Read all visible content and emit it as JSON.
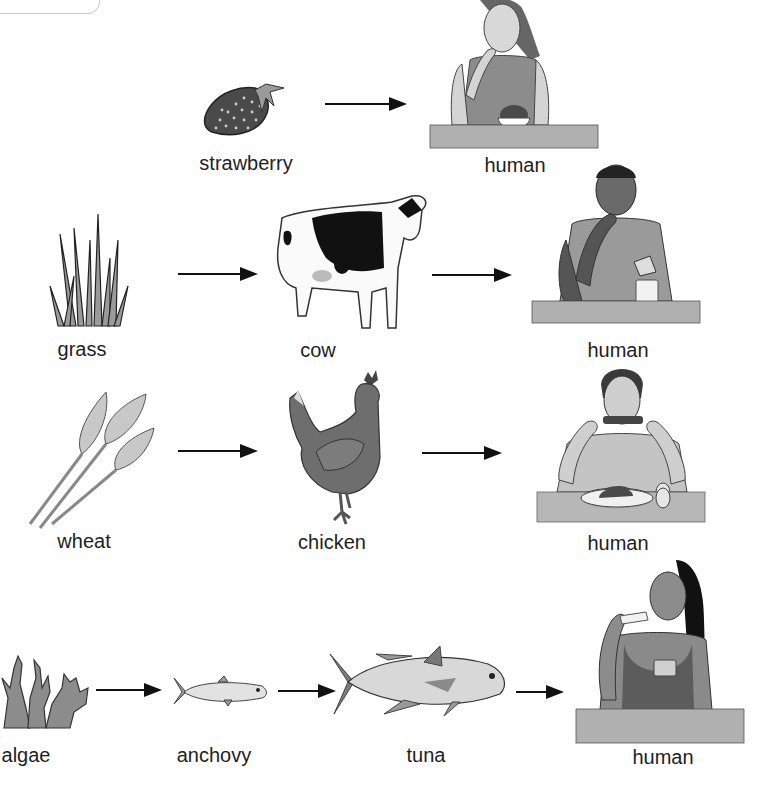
{
  "diagram": {
    "type": "food-chains",
    "colors": {
      "ink": "#111111",
      "fill_dark": "#555555",
      "fill_mid": "#8a8a8a",
      "fill_light": "#c9c9c9",
      "table": "#a9a9a9"
    },
    "chains": [
      {
        "organisms": [
          "strawberry",
          "human"
        ]
      },
      {
        "organisms": [
          "grass",
          "cow",
          "human"
        ]
      },
      {
        "organisms": [
          "wheat",
          "chicken",
          "human"
        ]
      },
      {
        "organisms": [
          "algae",
          "anchovy",
          "tuna",
          "human"
        ]
      }
    ],
    "labels": {
      "strawberry": "strawberry",
      "human1": "human",
      "grass": "grass",
      "cow": "cow",
      "human2": "human",
      "wheat": "wheat",
      "chicken": "chicken",
      "human3": "human",
      "algae": "algae",
      "anchovy": "anchovy",
      "tuna": "tuna",
      "human4": "human"
    },
    "icons": [
      "strawberry-icon",
      "woman-eating-icon",
      "grass-icon",
      "cow-icon",
      "boy-eating-icon",
      "wheat-icon",
      "chicken-icon",
      "man-eating-icon",
      "algae-icon",
      "anchovy-icon",
      "tuna-icon",
      "woman-eating-tuna-icon",
      "arrow-right-icon"
    ]
  }
}
